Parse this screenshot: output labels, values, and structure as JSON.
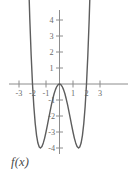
{
  "figure": {
    "function_label": "f(x)",
    "curve_color": "#5d5d5d",
    "axis_color": "#8c8c8c",
    "tick_label_color": "#6b6b6b"
  },
  "chart_data": {
    "type": "line",
    "title": "",
    "xlabel": "",
    "ylabel": "",
    "function_label": "f(x)",
    "expression": "x^4 - 4x^2",
    "xlim": [
      -3.6,
      3.6
    ],
    "ylim": [
      -4.9,
      5.0
    ],
    "grid": false,
    "legend_position": "none",
    "x_ticks": [
      -3,
      -2,
      -1,
      1,
      2,
      3
    ],
    "x_tick_labels": [
      "-3",
      "-2",
      "-1",
      "1",
      "2",
      "3"
    ],
    "y_ticks": [
      -4,
      -3,
      -2,
      -1,
      1,
      2,
      3,
      4
    ],
    "y_tick_labels": [
      "-4",
      "-3",
      "-2",
      "-1",
      "1",
      "2",
      "3",
      "4"
    ],
    "annotations": [
      {
        "label": "f(x)",
        "x": -3.3,
        "y": -5.6
      }
    ],
    "features": {
      "zeros": [
        -2,
        0,
        2
      ],
      "local_minima": [
        [
          -1.414,
          -4
        ],
        [
          1.414,
          -4
        ]
      ],
      "local_maxima": [
        [
          0,
          0
        ]
      ]
    },
    "x": [
      -2.35,
      -2.3,
      -2.2,
      -2.1,
      -2.0,
      -1.9,
      -1.8,
      -1.7,
      -1.6,
      -1.5,
      -1.414,
      -1.3,
      -1.2,
      -1.1,
      -1.0,
      -0.9,
      -0.8,
      -0.7,
      -0.6,
      -0.5,
      -0.4,
      -0.3,
      -0.2,
      -0.1,
      0,
      0.1,
      0.2,
      0.3,
      0.4,
      0.5,
      0.6,
      0.7,
      0.8,
      0.9,
      1.0,
      1.1,
      1.2,
      1.3,
      1.414,
      1.5,
      1.6,
      1.7,
      1.8,
      1.9,
      2.0,
      2.1,
      2.2,
      2.3,
      2.35
    ],
    "y": [
      8.4,
      6.8,
      4.06,
      1.81,
      0,
      -1.41,
      -2.46,
      -3.21,
      -3.69,
      -3.94,
      -4.0,
      -3.9,
      -3.68,
      -3.38,
      -3.0,
      -2.58,
      -2.15,
      -1.72,
      -1.31,
      -0.94,
      -0.61,
      -0.35,
      -0.16,
      -0.04,
      0,
      -0.04,
      -0.16,
      -0.35,
      -0.61,
      -0.94,
      -1.31,
      -1.72,
      -2.15,
      -2.58,
      -3.0,
      -3.38,
      -3.68,
      -3.9,
      -4.0,
      -3.94,
      -3.69,
      -3.21,
      -2.46,
      -1.41,
      0,
      1.81,
      4.06,
      6.8,
      8.4
    ]
  }
}
